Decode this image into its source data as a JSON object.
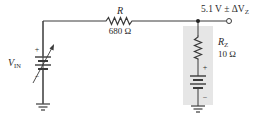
{
  "diagram": {
    "type": "zener-regulator-circuit",
    "source": {
      "label_main": "V",
      "label_sub": "IN",
      "plus": "+",
      "minus": "−",
      "variable": true
    },
    "series_resistor": {
      "name": "R",
      "value": "680 Ω"
    },
    "zener_model": {
      "name_main": "R",
      "name_sub": "Z",
      "value": "10 Ω",
      "plus": "+",
      "minus": "−"
    },
    "output": {
      "label_main": "5.1 V ± ΔV",
      "label_sub": "Z"
    },
    "colors": {
      "wire": "#3a3a3a",
      "shade": "#e6e6e6",
      "text": "#2a2a2a"
    }
  }
}
